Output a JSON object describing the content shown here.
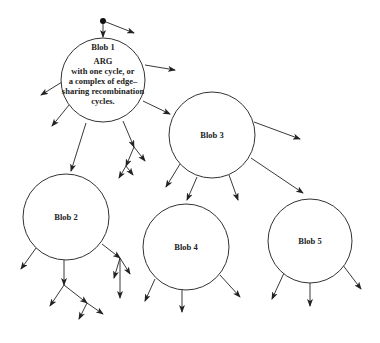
{
  "diagram": {
    "type": "tree-of-blobs",
    "stroke_color": "#222222",
    "background": "#ffffff",
    "blobs": [
      {
        "id": "blob1",
        "label": "Blob 1",
        "description_lines": [
          "ARG",
          "with one cycle, or",
          "a complex of edge–",
          "sharing recombination",
          "cycles."
        ],
        "cx": 103,
        "cy": 80,
        "r": 42
      },
      {
        "id": "blob2",
        "label": "Blob 2",
        "cx": 66,
        "cy": 217,
        "r": 43
      },
      {
        "id": "blob3",
        "label": "Blob 3",
        "cx": 212,
        "cy": 135,
        "r": 43
      },
      {
        "id": "blob4",
        "label": "Blob 4",
        "cx": 186,
        "cy": 247,
        "r": 43
      },
      {
        "id": "blob5",
        "label": "Blob 5",
        "cx": 310,
        "cy": 241,
        "r": 42
      }
    ],
    "root": {
      "x": 103,
      "y": 21
    },
    "edges": [
      [
        103,
        21,
        103,
        37
      ],
      [
        106,
        22,
        134,
        33
      ],
      [
        145,
        65,
        175,
        70
      ],
      [
        62,
        82,
        41,
        95
      ],
      [
        69,
        105,
        52,
        126
      ],
      [
        86,
        123,
        71,
        171
      ],
      [
        123,
        121,
        134,
        147
      ],
      [
        134,
        147,
        145,
        161
      ],
      [
        134,
        147,
        126,
        166
      ],
      [
        126,
        166,
        119,
        178
      ],
      [
        126,
        166,
        133,
        175
      ],
      [
        143,
        101,
        170,
        114
      ],
      [
        254,
        122,
        300,
        139
      ],
      [
        251,
        158,
        303,
        193
      ],
      [
        180,
        164,
        166,
        187
      ],
      [
        197,
        177,
        187,
        200
      ],
      [
        229,
        175,
        238,
        200
      ],
      [
        36,
        248,
        21,
        269
      ],
      [
        64,
        260,
        64,
        285
      ],
      [
        64,
        285,
        50,
        306
      ],
      [
        64,
        285,
        87,
        303
      ],
      [
        87,
        303,
        103,
        314
      ],
      [
        87,
        303,
        79,
        319
      ],
      [
        102,
        244,
        120,
        258
      ],
      [
        120,
        258,
        114,
        278
      ],
      [
        120,
        258,
        130,
        274
      ],
      [
        120,
        258,
        120,
        298
      ],
      [
        155,
        279,
        145,
        301
      ],
      [
        182,
        290,
        182,
        312
      ],
      [
        220,
        275,
        240,
        297
      ],
      [
        284,
        273,
        272,
        299
      ],
      [
        310,
        283,
        310,
        306
      ],
      [
        342,
        264,
        361,
        289
      ]
    ]
  }
}
